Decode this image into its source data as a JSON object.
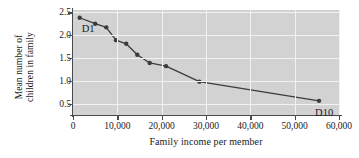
{
  "chart_data": {
    "type": "line",
    "title": "",
    "subtitle": "",
    "xlabel": "Family income per member",
    "ylabel_line1": "Mean number of",
    "ylabel_line2": "children in family",
    "xlim": [
      0,
      60000
    ],
    "ylim": [
      0.25,
      2.55
    ],
    "grid": true,
    "legend": "none",
    "xticks": [
      0,
      10000,
      20000,
      30000,
      40000,
      50000,
      60000
    ],
    "xticklabels": [
      "0",
      "10,000",
      "20,000",
      "30,000",
      "40,000",
      "50,000",
      "60,000"
    ],
    "yticks": [
      0.5,
      1.0,
      1.5,
      2.0,
      2.5
    ],
    "yticklabels": [
      "0.5",
      "1.0",
      "1.5",
      "2.0",
      "2.5"
    ],
    "series": [
      {
        "name": "Mean children by income decile",
        "marker": "filled-circle",
        "color": "#3c3c3c",
        "x": [
          1500,
          5000,
          7500,
          9700,
          12000,
          14500,
          17300,
          21000,
          28500,
          55500
        ],
        "y": [
          2.38,
          2.25,
          2.17,
          1.89,
          1.81,
          1.57,
          1.39,
          1.32,
          0.98,
          0.56
        ],
        "point_labels": [
          "D1",
          "",
          "",
          "",
          "",
          "",
          "",
          "",
          "",
          "D10"
        ]
      }
    ],
    "annotations": [
      {
        "text": "D1",
        "x": 1500,
        "y": 2.38,
        "dx": 2,
        "dy": 16
      },
      {
        "text": "D10",
        "x": 55500,
        "y": 0.56,
        "dx": -4,
        "dy": 17
      }
    ],
    "plot_bg_color": "#d2d2d2",
    "gridline_color": "#f2f2f2",
    "axis_color": "#4a4a4a"
  }
}
